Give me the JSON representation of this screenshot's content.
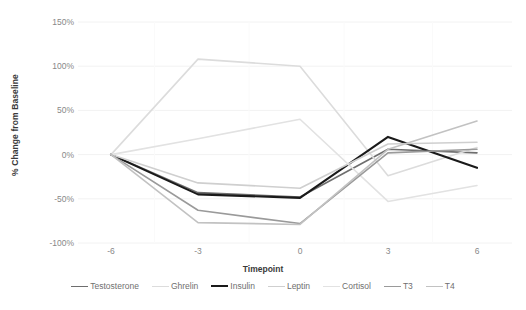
{
  "chart_data": {
    "type": "line",
    "title": "",
    "xlabel": "Timepoint",
    "ylabel": "% Change from Baseline",
    "x": [
      -6,
      -3,
      0,
      3,
      6
    ],
    "x_tick_labels": [
      "-6",
      "-3",
      "0",
      "3",
      "6"
    ],
    "y_tick_labels": [
      "150%",
      "100%",
      "50%",
      "0%",
      "-50%",
      "-100%"
    ],
    "y_tick_values": [
      150,
      100,
      50,
      0,
      -50,
      -100
    ],
    "ylim": [
      -100,
      150
    ],
    "grid": true,
    "legend_position": "bottom",
    "series": [
      {
        "name": "Testosterone",
        "color": "#6e6e6e",
        "width": 1.6,
        "values": [
          0,
          -43,
          -48,
          6,
          2
        ]
      },
      {
        "name": "Ghrelin",
        "color": "#dcdcdc",
        "width": 1.6,
        "values": [
          0,
          108,
          100,
          -24,
          8
        ]
      },
      {
        "name": "Insulin",
        "color": "#1a1a1a",
        "width": 2.1,
        "values": [
          0,
          -45,
          -49,
          20,
          -15
        ]
      },
      {
        "name": "Leptin",
        "color": "#cfcfcf",
        "width": 1.6,
        "values": [
          0,
          -32,
          -38,
          12,
          14
        ]
      },
      {
        "name": "Cortisol",
        "color": "#e2e2e2",
        "width": 1.6,
        "values": [
          0,
          18,
          40,
          -53,
          -35
        ]
      },
      {
        "name": "T3",
        "color": "#9a9a9a",
        "width": 1.6,
        "values": [
          0,
          -63,
          -78,
          2,
          6
        ]
      },
      {
        "name": "T4",
        "color": "#c2c2c2",
        "width": 1.6,
        "values": [
          0,
          -77,
          -79,
          6,
          38
        ]
      }
    ]
  },
  "axis": {
    "y_title": "% Change from Baseline",
    "x_title": "Timepoint"
  },
  "colors": {
    "tick_text": "#888888",
    "axis_title_text": "#3a3a3a",
    "legend_text": "#6f6f6f",
    "gridline": "#f2f2f2",
    "background": "#ffffff"
  }
}
